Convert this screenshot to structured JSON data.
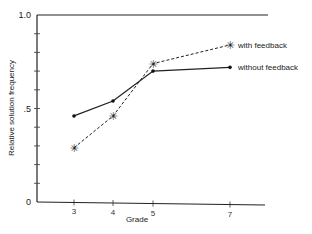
{
  "chart_data": {
    "type": "line",
    "title": "",
    "xlabel": "Grade",
    "ylabel": "Relative solution frequency",
    "ylim": [
      0,
      1.0
    ],
    "yticks": [
      0,
      0.1,
      0.2,
      0.3,
      0.4,
      0.5,
      0.6,
      0.7,
      0.8,
      0.9,
      1.0
    ],
    "ytick_labels": [
      {
        "value": 0,
        "label": "0"
      },
      {
        "value": 0.5,
        "label": ".5"
      },
      {
        "value": 1.0,
        "label": "1.0"
      }
    ],
    "x": [
      3,
      4,
      5,
      7
    ],
    "xtick_labels": [
      "3",
      "4",
      "5",
      "7"
    ],
    "grid": false,
    "legend_position": "inline-right",
    "series": [
      {
        "name": "with feedback",
        "style": "dashed",
        "marker": "asterisk",
        "values": [
          0.29,
          0.46,
          0.74,
          0.84
        ]
      },
      {
        "name": "without feedback",
        "style": "solid",
        "marker": "dot",
        "values": [
          0.46,
          0.54,
          0.7,
          0.72
        ]
      }
    ]
  },
  "caption_fragment": ""
}
